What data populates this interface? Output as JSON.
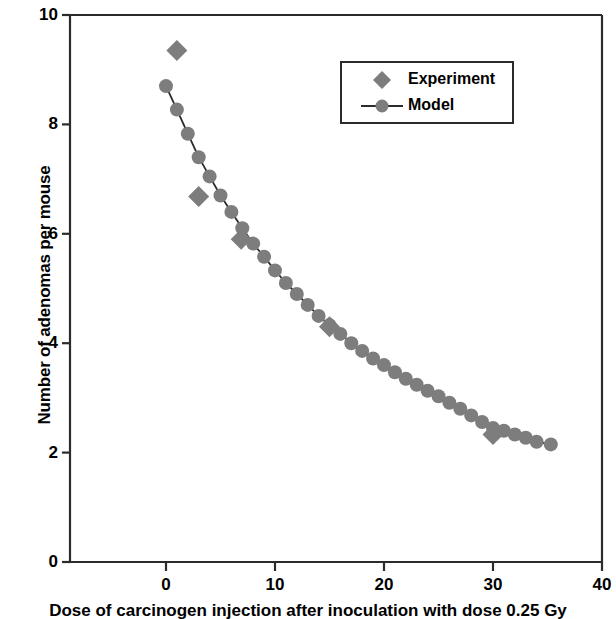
{
  "chart_data": {
    "type": "scatter",
    "title": "",
    "xlabel": "Dose of carcinogen injection after inoculation with dose 0.25 Gy",
    "ylabel": "Number of adenomas per mouse",
    "xlim": [
      -5,
      40
    ],
    "ylim": [
      0,
      10
    ],
    "xticks": [
      0,
      10,
      20,
      30,
      40
    ],
    "yticks": [
      0,
      2,
      4,
      6,
      8,
      10
    ],
    "grid": false,
    "legend_position": "upper-right",
    "colors": {
      "marker_gray": "#7d7d7d",
      "line_black": "#2b2b2b",
      "axis_black": "#2b2b2b",
      "text_black": "#000000",
      "background": "#ffffff"
    },
    "series": [
      {
        "name": "Experiment",
        "marker": "diamond",
        "color": "#7d7d7d",
        "line": false,
        "points": [
          {
            "x": 1.0,
            "y": 9.35
          },
          {
            "x": 3.0,
            "y": 6.68
          },
          {
            "x": 6.9,
            "y": 5.9
          },
          {
            "x": 15.0,
            "y": 4.3
          },
          {
            "x": 30.0,
            "y": 2.33
          }
        ]
      },
      {
        "name": "Model",
        "marker": "circle",
        "color": "#7d7d7d",
        "line": true,
        "points": [
          {
            "x": 0.0,
            "y": 8.7
          },
          {
            "x": 1.0,
            "y": 8.27
          },
          {
            "x": 2.0,
            "y": 7.83
          },
          {
            "x": 3.0,
            "y": 7.4
          },
          {
            "x": 4.0,
            "y": 7.05
          },
          {
            "x": 5.0,
            "y": 6.7
          },
          {
            "x": 6.0,
            "y": 6.4
          },
          {
            "x": 7.0,
            "y": 6.1
          },
          {
            "x": 8.0,
            "y": 5.82
          },
          {
            "x": 9.0,
            "y": 5.58
          },
          {
            "x": 10.0,
            "y": 5.33
          },
          {
            "x": 11.0,
            "y": 5.1
          },
          {
            "x": 12.0,
            "y": 4.9
          },
          {
            "x": 13.0,
            "y": 4.7
          },
          {
            "x": 14.0,
            "y": 4.5
          },
          {
            "x": 15.0,
            "y": 4.33
          },
          {
            "x": 16.0,
            "y": 4.17
          },
          {
            "x": 17.0,
            "y": 4.0
          },
          {
            "x": 18.0,
            "y": 3.86
          },
          {
            "x": 19.0,
            "y": 3.72
          },
          {
            "x": 20.0,
            "y": 3.6
          },
          {
            "x": 21.0,
            "y": 3.47
          },
          {
            "x": 22.0,
            "y": 3.35
          },
          {
            "x": 23.0,
            "y": 3.24
          },
          {
            "x": 24.0,
            "y": 3.13
          },
          {
            "x": 25.0,
            "y": 3.03
          },
          {
            "x": 26.0,
            "y": 2.91
          },
          {
            "x": 27.0,
            "y": 2.8
          },
          {
            "x": 28.0,
            "y": 2.68
          },
          {
            "x": 29.0,
            "y": 2.56
          },
          {
            "x": 30.0,
            "y": 2.45
          },
          {
            "x": 31.0,
            "y": 2.4
          },
          {
            "x": 32.0,
            "y": 2.33
          },
          {
            "x": 33.0,
            "y": 2.27
          },
          {
            "x": 34.0,
            "y": 2.2
          },
          {
            "x": 35.3,
            "y": 2.15
          }
        ]
      }
    ]
  },
  "axis": {
    "y_title": "Number of adenomas per mouse",
    "x_title": "Dose of carcinogen injection after inoculation with dose 0.25 Gy",
    "y_tick_labels": [
      "10",
      "8",
      "6",
      "4",
      "2",
      "0"
    ],
    "x_tick_labels": [
      "0",
      "10",
      "20",
      "30",
      "40"
    ]
  },
  "legend": {
    "entries": [
      {
        "label": "Experiment",
        "symbol": "diamond-marker"
      },
      {
        "label": "Model",
        "symbol": "line-circle-marker"
      }
    ]
  }
}
